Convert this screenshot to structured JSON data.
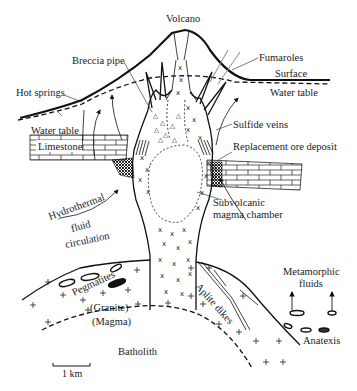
{
  "diagram": {
    "labels": {
      "volcano": "Volcano",
      "fumaroles": "Fumaroles",
      "surface": "Surface",
      "water_table_right": "Water table",
      "water_table_left": "Water table",
      "breccia_pipe": "Breccia pipe",
      "hot_springs": "Hot springs",
      "sulfide_veins": "Sulfide veins",
      "replacement_ore_deposit": "Replacement ore deposit",
      "limestone": "Limestone",
      "subvolcanic_line1": "Subvolcanic",
      "subvolcanic_line2": "magma chamber",
      "hydrothermal": "Hydrothermal",
      "fluid": "fluid",
      "circulation": "circulation",
      "pegmatites": "Pegmatites",
      "granite": "(Granite)",
      "magma": "(Magma)",
      "aplite_dikes": "Aplite dikes",
      "metamorphic_line1": "Metamorphic",
      "metamorphic_line2": "fluids",
      "anatexis": "Anatexis",
      "batholith": "Batholith"
    },
    "scale_bar": {
      "label": "1 km"
    },
    "colors": {
      "ink": "#111111",
      "background": "#ffffff"
    }
  }
}
